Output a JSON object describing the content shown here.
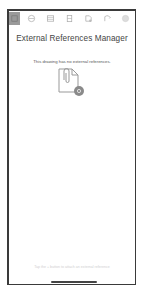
{
  "toolbar": {
    "items": [
      {
        "icon": "grid-icon",
        "active": true
      },
      {
        "icon": "layers-icon",
        "active": false
      },
      {
        "icon": "properties-icon",
        "active": false
      },
      {
        "icon": "blocks-icon",
        "active": false
      },
      {
        "icon": "attach-icon",
        "active": false
      },
      {
        "icon": "xref-icon",
        "active": false
      },
      {
        "icon": "settings-icon",
        "active": false
      }
    ]
  },
  "panel": {
    "title": "External References Manager",
    "empty_message": "This drawing has no external references.",
    "empty_icon": "paperclip-document-icon",
    "badge_color": "#8a8a8a",
    "hint": "Tap the + button to attach an external reference"
  }
}
